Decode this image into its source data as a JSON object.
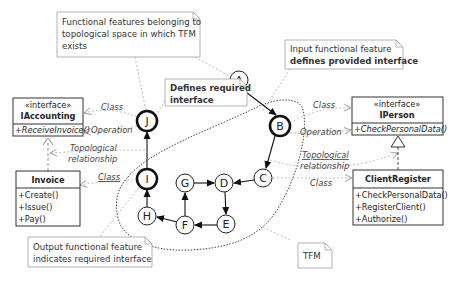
{
  "notes": {
    "topological_space": [
      "Functional features belonging to",
      "topological space in which TFM",
      "exists"
    ],
    "input_feature": {
      "line1": "Input functional feature",
      "line2": "defines provided interface"
    },
    "defines_required": {
      "line1": "Defines required",
      "line2": "interface"
    },
    "output_feature": {
      "line1": "Output functional feature",
      "line2": "indicates required interface"
    },
    "tfm": "TFM"
  },
  "classes": {
    "iaccounting": {
      "stereotype": "«interface»",
      "name": "IAccounting",
      "operations": [
        "+ReceiveInvoice()"
      ]
    },
    "invoice": {
      "name": "Invoice",
      "operations": [
        "+Create()",
        "+Issue()",
        "+Pay()"
      ]
    },
    "iperson": {
      "stereotype": "«interface»",
      "name": "IPerson",
      "operations": [
        "+CheckPersonalData()"
      ]
    },
    "clientregister": {
      "name": "ClientRegister",
      "operations": [
        "+CheckPersonalData()",
        "+RegisterClient()",
        "+Authorize()"
      ]
    }
  },
  "labels": {
    "class_left_top": "Class",
    "operation_left": "Operation",
    "topo_left_1": "Topological",
    "topo_left_2": "relationship",
    "class_left_bottom": "Class",
    "class_right_top": "Class",
    "operation_right": "Operation",
    "topo_right_1": "Topological",
    "topo_right_2": "relationship",
    "class_right_bottom": "Class"
  },
  "nodes": {
    "A": "A",
    "B": "B",
    "C": "C",
    "D": "D",
    "E": "E",
    "F": "F",
    "G": "G",
    "H": "H",
    "I": "I",
    "J": "J"
  }
}
